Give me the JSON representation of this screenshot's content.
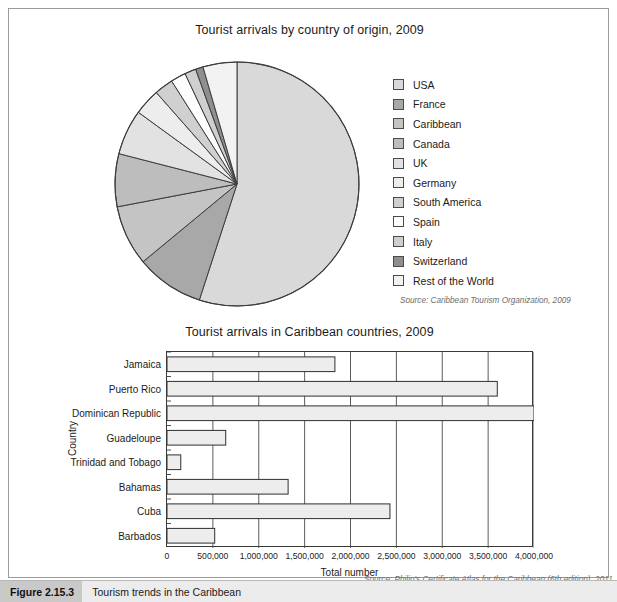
{
  "figure": {
    "tag": "Figure 2.15.3",
    "caption": "Tourism trends in the Caribbean"
  },
  "pie_panel": {
    "title": "Tourist arrivals by country of origin, 2009",
    "source": "Source: Caribbean Tourism Organization, 2009"
  },
  "bar_panel": {
    "title": "Tourist arrivals in Caribbean countries, 2009",
    "source": "Source: Philip's Certificate Atlas for the Caribbean (6th edition), 2011",
    "x_axis_title": "Total number",
    "y_axis_title": "Country"
  },
  "chart_data": [
    {
      "type": "pie",
      "title": "Tourist arrivals by country of origin, 2009",
      "legend_position": "right",
      "labels": [
        "USA",
        "France",
        "Caribbean",
        "Canada",
        "UK",
        "Germany",
        "South America",
        "Spain",
        "Italy",
        "Switzerland",
        "Rest of the World"
      ],
      "values": [
        55.0,
        9.0,
        8.0,
        7.0,
        6.0,
        3.5,
        2.5,
        2.0,
        1.5,
        1.0,
        4.5
      ],
      "colors": [
        "#d9d9d9",
        "#a8a8a8",
        "#c4c4c4",
        "#bdbdbd",
        "#e2e2e2",
        "#ededed",
        "#d0d0d0",
        "#fdfdfd",
        "#cfcfcf",
        "#8f8f8f",
        "#f2f2f2"
      ]
    },
    {
      "type": "bar",
      "orientation": "horizontal",
      "title": "Tourist arrivals in Caribbean countries, 2009",
      "xlabel": "Total number",
      "ylabel": "Country",
      "categories": [
        "Jamaica",
        "Puerto Rico",
        "Dominican Republic",
        "Guadeloupe",
        "Trinidad and Tobago",
        "Bahamas",
        "Cuba",
        "Barbados"
      ],
      "values": [
        1830000,
        3600000,
        4000000,
        640000,
        150000,
        1320000,
        2430000,
        520000
      ],
      "xlim": [
        0,
        4000000
      ],
      "xticks": [
        0,
        500000,
        1000000,
        1500000,
        2000000,
        2500000,
        3000000,
        3500000,
        4000000
      ],
      "xtick_labels": [
        "0",
        "500,000",
        "1,000,000",
        "1,500,000",
        "2,000,000",
        "2,500,000",
        "3,000,000",
        "3,500,000",
        "4,000,000"
      ],
      "grid": true,
      "bar_fill": "#ededed",
      "bar_stroke": "#2f2f2f"
    }
  ]
}
